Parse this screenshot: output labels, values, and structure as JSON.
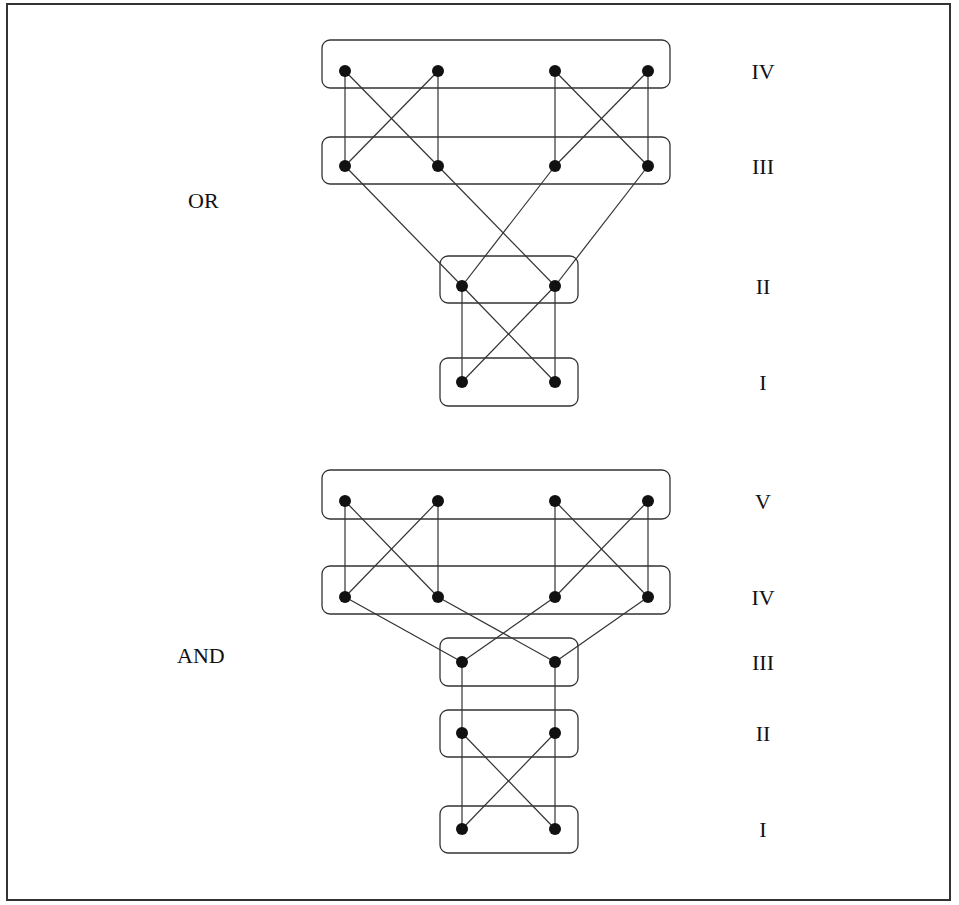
{
  "diagrams": [
    {
      "title": "OR",
      "title_pos": [
        188,
        208
      ],
      "levels": [
        {
          "label": "IV",
          "y": 71,
          "box": [
            322,
            40,
            348,
            48
          ],
          "nodes_x": [
            345,
            438,
            555,
            648
          ]
        },
        {
          "label": "III",
          "y": 166,
          "box": [
            322,
            137,
            348,
            47
          ],
          "nodes_x": [
            345,
            438,
            555,
            648
          ]
        },
        {
          "label": "II",
          "y": 286,
          "box": [
            440,
            256,
            138,
            47
          ],
          "nodes_x": [
            462,
            555
          ]
        },
        {
          "label": "I",
          "y": 382,
          "box": [
            440,
            358,
            138,
            48
          ],
          "nodes_x": [
            462,
            555
          ]
        }
      ],
      "edges": [
        [
          [
            345,
            71
          ],
          [
            345,
            166
          ]
        ],
        [
          [
            345,
            71
          ],
          [
            438,
            166
          ]
        ],
        [
          [
            438,
            71
          ],
          [
            345,
            166
          ]
        ],
        [
          [
            438,
            71
          ],
          [
            438,
            166
          ]
        ],
        [
          [
            555,
            71
          ],
          [
            555,
            166
          ]
        ],
        [
          [
            555,
            71
          ],
          [
            648,
            166
          ]
        ],
        [
          [
            648,
            71
          ],
          [
            555,
            166
          ]
        ],
        [
          [
            648,
            71
          ],
          [
            648,
            166
          ]
        ],
        [
          [
            345,
            166
          ],
          [
            462,
            286
          ]
        ],
        [
          [
            438,
            166
          ],
          [
            555,
            286
          ]
        ],
        [
          [
            555,
            166
          ],
          [
            462,
            286
          ]
        ],
        [
          [
            648,
            166
          ],
          [
            555,
            286
          ]
        ],
        [
          [
            462,
            286
          ],
          [
            462,
            382
          ]
        ],
        [
          [
            462,
            286
          ],
          [
            555,
            382
          ]
        ],
        [
          [
            555,
            286
          ],
          [
            462,
            382
          ]
        ],
        [
          [
            555,
            286
          ],
          [
            555,
            382
          ]
        ]
      ]
    },
    {
      "title": "AND",
      "title_pos": [
        177,
        663
      ],
      "levels": [
        {
          "label": "V",
          "y": 501,
          "box": [
            322,
            470,
            348,
            49
          ],
          "nodes_x": [
            345,
            438,
            555,
            648
          ]
        },
        {
          "label": "IV",
          "y": 597,
          "box": [
            322,
            566,
            348,
            48
          ],
          "nodes_x": [
            345,
            438,
            555,
            648
          ]
        },
        {
          "label": "III",
          "y": 662,
          "box": [
            440,
            638,
            138,
            48
          ],
          "nodes_x": [
            462,
            555
          ]
        },
        {
          "label": "II",
          "y": 733,
          "box": [
            440,
            710,
            138,
            47
          ],
          "nodes_x": [
            462,
            555
          ]
        },
        {
          "label": "I",
          "y": 829,
          "box": [
            440,
            806,
            138,
            47
          ],
          "nodes_x": [
            462,
            555
          ]
        }
      ],
      "edges": [
        [
          [
            345,
            501
          ],
          [
            345,
            597
          ]
        ],
        [
          [
            345,
            501
          ],
          [
            438,
            597
          ]
        ],
        [
          [
            438,
            501
          ],
          [
            345,
            597
          ]
        ],
        [
          [
            438,
            501
          ],
          [
            438,
            597
          ]
        ],
        [
          [
            555,
            501
          ],
          [
            555,
            597
          ]
        ],
        [
          [
            555,
            501
          ],
          [
            648,
            597
          ]
        ],
        [
          [
            648,
            501
          ],
          [
            555,
            597
          ]
        ],
        [
          [
            648,
            501
          ],
          [
            648,
            597
          ]
        ],
        [
          [
            345,
            597
          ],
          [
            462,
            662
          ]
        ],
        [
          [
            438,
            597
          ],
          [
            555,
            662
          ]
        ],
        [
          [
            555,
            597
          ],
          [
            462,
            662
          ]
        ],
        [
          [
            648,
            597
          ],
          [
            555,
            662
          ]
        ],
        [
          [
            462,
            662
          ],
          [
            462,
            733
          ]
        ],
        [
          [
            555,
            662
          ],
          [
            555,
            733
          ]
        ],
        [
          [
            462,
            733
          ],
          [
            462,
            829
          ]
        ],
        [
          [
            462,
            733
          ],
          [
            555,
            829
          ]
        ],
        [
          [
            555,
            733
          ],
          [
            462,
            829
          ]
        ],
        [
          [
            555,
            733
          ],
          [
            555,
            829
          ]
        ]
      ]
    }
  ],
  "level_label_x": 763
}
